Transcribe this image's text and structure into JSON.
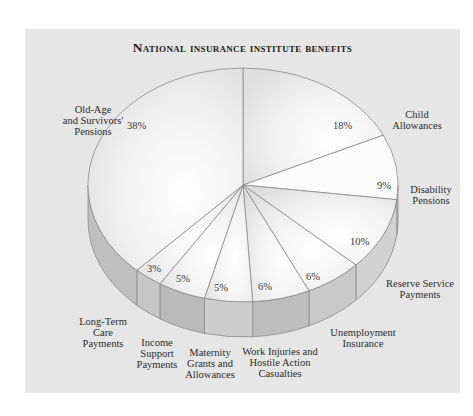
{
  "chart_data": {
    "type": "pie",
    "title": "National insurance institute benefits",
    "style": "3d-pie",
    "categories": [
      "Old-Age and Survivors' Pensions",
      "Child Allowances",
      "Disability Pensions",
      "Reserve Service Payments",
      "Unemployment Insurance",
      "Work Injuries and Hostile Action Casualties",
      "Maternity Grants and Allowances",
      "Income Support Payments",
      "Long-Term Care Payments"
    ],
    "values": [
      38,
      18,
      9,
      10,
      6,
      6,
      5,
      5,
      3
    ],
    "unit": "%",
    "legend": "none (direct labels)"
  },
  "title": "National insurance institute benefits",
  "labels": {
    "old_age": [
      "Old-Age",
      "and Survivors'",
      "Pensions"
    ],
    "child": [
      "Child",
      "Allowances"
    ],
    "disability": [
      "Disability",
      "Pensions"
    ],
    "reserve": [
      "Reserve Service",
      "Payments"
    ],
    "unemployment": [
      "Unemployment",
      "Insurance"
    ],
    "work": [
      "Work Injuries and",
      "Hostile Action",
      "Casualties"
    ],
    "maternity": [
      "Maternity",
      "Grants and",
      "Allowances"
    ],
    "income": [
      "Income",
      "Support",
      "Payments"
    ],
    "longterm": [
      "Long-Term",
      "Care",
      "Payments"
    ]
  },
  "percents": {
    "old_age": "38%",
    "child": "18%",
    "disability": "9%",
    "reserve": "10%",
    "unemployment": "6%",
    "work": "6%",
    "maternity": "5%",
    "income": "5%",
    "longterm": "3%"
  },
  "colors": {
    "panel": "#e6e6e6",
    "top_light": "#fbfbfb",
    "top_mid": "#eaeaea",
    "side_light": "#d6d6d6",
    "side_dark": "#bcbcbc",
    "stroke": "#8a8a8a"
  }
}
